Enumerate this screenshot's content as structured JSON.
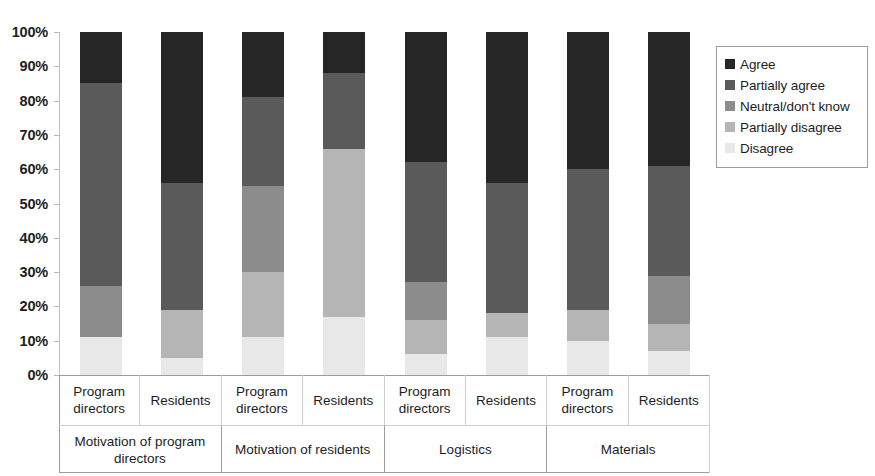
{
  "chart_data": {
    "type": "bar",
    "subtype": "stacked-100-percent",
    "title": "",
    "xlabel": "",
    "ylabel": "",
    "ylim": [
      0,
      100
    ],
    "grid": false,
    "legend_position": "right",
    "y_tick_labels": [
      "100%",
      "90%",
      "80%",
      "70%",
      "60%",
      "50%",
      "40%",
      "30%",
      "20%",
      "10%",
      "0%"
    ],
    "y_tick_values": [
      100,
      90,
      80,
      70,
      60,
      50,
      40,
      30,
      20,
      10,
      0
    ],
    "groups": [
      {
        "label": "Motivation of program directors",
        "bars": [
          "Program directors",
          "Residents"
        ]
      },
      {
        "label": "Motivation of residents",
        "bars": [
          "Program directors",
          "Residents"
        ]
      },
      {
        "label": "Logistics",
        "bars": [
          "Program directors",
          "Residents"
        ]
      },
      {
        "label": "Materials",
        "bars": [
          "Program directors",
          "Residents"
        ]
      }
    ],
    "categories": [
      "Motivation of program directors - Program directors",
      "Motivation of program directors - Residents",
      "Motivation of residents - Program directors",
      "Motivation of residents - Residents",
      "Logistics - Program directors",
      "Logistics - Residents",
      "Materials - Program directors",
      "Materials - Residents"
    ],
    "series": [
      {
        "name": "Agree",
        "color": "#262626",
        "values": [
          15,
          44,
          19,
          12,
          38,
          44,
          40,
          39
        ]
      },
      {
        "name": "Partially agree",
        "color": "#5a5a5a",
        "values": [
          59,
          37,
          26,
          22,
          35,
          38,
          41,
          32
        ]
      },
      {
        "name": "Neutral/don't know",
        "color": "#8c8c8c",
        "values": [
          15,
          0,
          25,
          0,
          11,
          0,
          0,
          14
        ]
      },
      {
        "name": "Partially disagree",
        "color": "#b5b5b5",
        "values": [
          0,
          14,
          19,
          49,
          10,
          7,
          9,
          8
        ]
      },
      {
        "name": "Disagree",
        "color": "#e8e8e8",
        "values": [
          11,
          5,
          11,
          17,
          6,
          11,
          10,
          7
        ]
      }
    ]
  },
  "legend": {
    "items": [
      {
        "label": "Agree",
        "color": "#262626"
      },
      {
        "label": "Partially agree",
        "color": "#5a5a5a"
      },
      {
        "label": "Neutral/don't know",
        "color": "#8c8c8c"
      },
      {
        "label": "Partially disagree",
        "color": "#b5b5b5"
      },
      {
        "label": "Disagree",
        "color": "#e8e8e8"
      }
    ]
  }
}
